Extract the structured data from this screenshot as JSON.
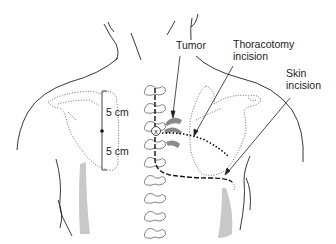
{
  "diagram": {
    "type": "anatomical-surgical-illustration",
    "colors": {
      "outline": "#222222",
      "dotted_outline": "#555555",
      "vertebra": "#777777",
      "rib_shading": "#8a8a8a",
      "soft_shading": "#c9c9c9",
      "scale_bar": "#666666"
    },
    "labels": {
      "tumor": "Tumor",
      "thoracotomy_line1": "Thoracotomy",
      "thoracotomy_line2": "incision",
      "skin_line1": "Skin",
      "skin_line2": "incision",
      "scale_upper": "5 cm",
      "scale_lower": "5 cm"
    },
    "markers": {
      "spine_marker": "x"
    },
    "vertebra_count": 9,
    "legend": [
      {
        "name": "tumor",
        "style": "gray shaded rib segments"
      },
      {
        "name": "thoracotomy incision",
        "style": "dotted line"
      },
      {
        "name": "skin incision",
        "style": "dashed line"
      }
    ]
  }
}
